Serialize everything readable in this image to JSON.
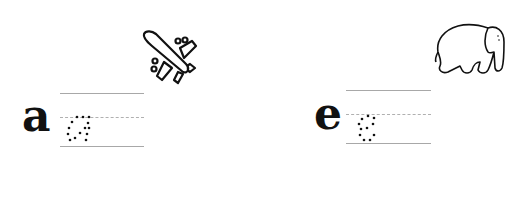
{
  "worksheet": {
    "items": [
      {
        "letter": "a",
        "trace_letter": "a",
        "picture": "airplane-icon"
      },
      {
        "letter": "e",
        "trace_letter": "e",
        "picture": "elephant-icon"
      }
    ]
  }
}
